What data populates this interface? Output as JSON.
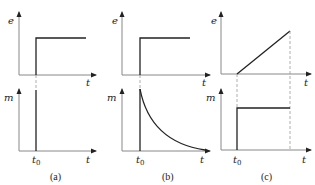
{
  "panels": [
    {
      "id": "a",
      "caption": "(a)",
      "top": {
        "y_label": "e",
        "x_label": "t",
        "signal": "step"
      },
      "bottom": {
        "y_label": "m",
        "x_label": "t",
        "signal": "impulse",
        "t0_label": "t"
      }
    },
    {
      "id": "b",
      "caption": "(b)",
      "top": {
        "y_label": "e",
        "x_label": "t",
        "signal": "step"
      },
      "bottom": {
        "y_label": "m",
        "x_label": "t",
        "signal": "exponential-decay",
        "t0_label": "t"
      }
    },
    {
      "id": "c",
      "caption": "(c)",
      "top": {
        "y_label": "e",
        "x_label": "t",
        "signal": "ramp"
      },
      "bottom": {
        "y_label": "m",
        "x_label": "t",
        "signal": "step",
        "t0_label": "t"
      }
    }
  ],
  "subscript": "0",
  "colors": {
    "signal": "#222222",
    "axis": "#888888",
    "dashed": "#999999"
  }
}
